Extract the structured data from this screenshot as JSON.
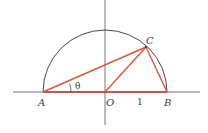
{
  "diagram": {
    "title": "",
    "points": {
      "A": {
        "label": "A"
      },
      "O": {
        "label": "O"
      },
      "B": {
        "label": "B"
      },
      "C": {
        "label": "C"
      }
    },
    "angle_label": "θ",
    "radius_label": "1",
    "colors": {
      "axes": "#555555",
      "circle": "#333333",
      "segments": "#d9573f",
      "base_segment": "#c0392b"
    },
    "segments": [
      {
        "from": "A",
        "to": "C"
      },
      {
        "from": "O",
        "to": "C"
      },
      {
        "from": "C",
        "to": "B"
      },
      {
        "from": "A",
        "to": "B"
      }
    ]
  }
}
